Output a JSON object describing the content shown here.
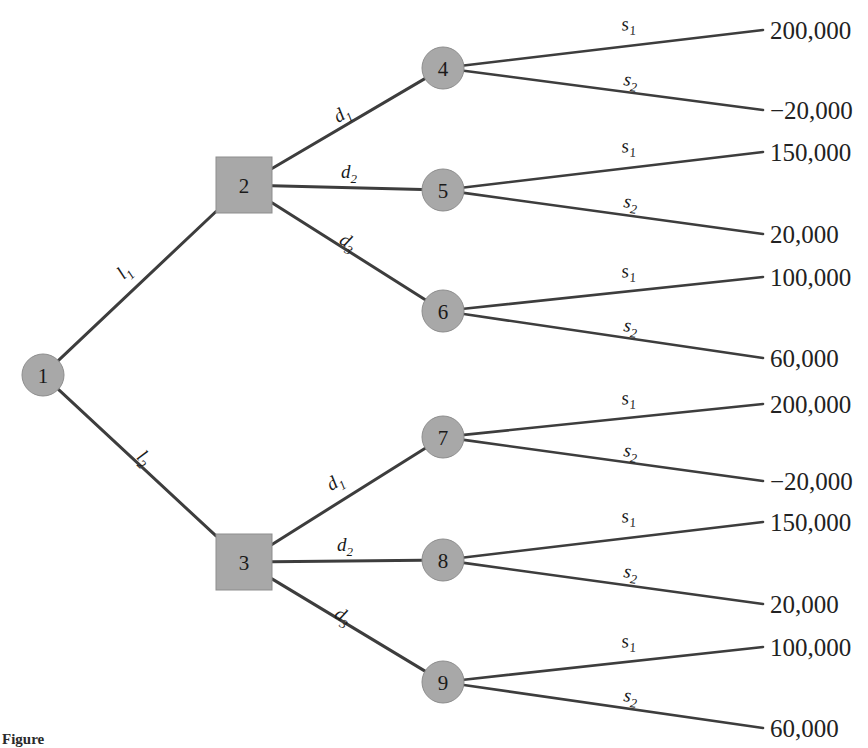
{
  "figure": {
    "caption_prefix": "Figure",
    "caption_number": "",
    "caption_text": ""
  },
  "nodes": [
    {
      "id": "1",
      "label": "1",
      "type": "chance",
      "shape": "circle",
      "cx": 43,
      "cy": 375
    },
    {
      "id": "2",
      "label": "2",
      "type": "decision",
      "shape": "square",
      "cx": 244,
      "cy": 185
    },
    {
      "id": "3",
      "label": "3",
      "type": "decision",
      "shape": "square",
      "cx": 244,
      "cy": 562
    },
    {
      "id": "4",
      "label": "4",
      "type": "chance",
      "shape": "circle",
      "cx": 443,
      "cy": 68
    },
    {
      "id": "5",
      "label": "5",
      "type": "chance",
      "shape": "circle",
      "cx": 443,
      "cy": 190
    },
    {
      "id": "6",
      "label": "6",
      "type": "chance",
      "shape": "circle",
      "cx": 443,
      "cy": 311
    },
    {
      "id": "7",
      "label": "7",
      "type": "chance",
      "shape": "circle",
      "cx": 443,
      "cy": 437
    },
    {
      "id": "8",
      "label": "8",
      "type": "chance",
      "shape": "circle",
      "cx": 443,
      "cy": 560
    },
    {
      "id": "9",
      "label": "9",
      "type": "chance",
      "shape": "circle",
      "cx": 443,
      "cy": 682
    }
  ],
  "branches": {
    "from_root": [
      {
        "base": "l",
        "sub": "1",
        "label": "l1",
        "to": "2",
        "label_x": 128,
        "label_y": 276
      },
      {
        "base": "l",
        "sub": "2",
        "label": "l2",
        "to": "3",
        "label_x": 140,
        "label_y": 462
      }
    ],
    "decision_upper": [
      {
        "base": "d",
        "sub": "1",
        "label": "d1",
        "to": "4",
        "label_x": 345,
        "label_y": 119
      },
      {
        "base": "d",
        "sub": "2",
        "label": "d2",
        "to": "5",
        "label_x": 349,
        "label_y": 178
      },
      {
        "base": "d",
        "sub": "3",
        "label": "d3",
        "to": "6",
        "label_x": 345,
        "label_y": 247
      }
    ],
    "decision_lower": [
      {
        "base": "d",
        "sub": "1",
        "label": "d1",
        "to": "7",
        "label_x": 338,
        "label_y": 487
      },
      {
        "base": "d",
        "sub": "2",
        "label": "d2",
        "to": "8",
        "label_x": 345,
        "label_y": 551
      },
      {
        "base": "d",
        "sub": "3",
        "label": "d3",
        "to": "9",
        "label_x": 340,
        "label_y": 621
      }
    ]
  },
  "state_labels": [
    {
      "base": "s",
      "sub": "1",
      "label": "s1"
    },
    {
      "base": "s",
      "sub": "2",
      "label": "s2"
    }
  ],
  "outcomes": [
    {
      "node": "4",
      "state_base": "s",
      "state_sub": "1",
      "state": "s1",
      "payoff": "200,000",
      "label_x": 629,
      "label_y": 30,
      "line_y2": 30,
      "text_y": 30
    },
    {
      "node": "4",
      "state_base": "s",
      "state_sub": "2",
      "state": "s2",
      "payoff": "−20,000",
      "label_x": 630,
      "label_y": 86,
      "line_y2": 110,
      "text_y": 110
    },
    {
      "node": "5",
      "state_base": "s",
      "state_sub": "1",
      "state": "s1",
      "payoff": "150,000",
      "label_x": 629,
      "label_y": 152,
      "line_y2": 152,
      "text_y": 152
    },
    {
      "node": "5",
      "state_base": "s",
      "state_sub": "2",
      "state": "s2",
      "payoff": "20,000",
      "label_x": 630,
      "label_y": 208,
      "line_y2": 234,
      "text_y": 234
    },
    {
      "node": "6",
      "state_base": "s",
      "state_sub": "1",
      "state": "s1",
      "payoff": "100,000",
      "label_x": 629,
      "label_y": 277,
      "line_y2": 277,
      "text_y": 277
    },
    {
      "node": "6",
      "state_base": "s",
      "state_sub": "2",
      "state": "s2",
      "payoff": "60,000",
      "label_x": 630,
      "label_y": 332,
      "line_y2": 358,
      "text_y": 358
    },
    {
      "node": "7",
      "state_base": "s",
      "state_sub": "1",
      "state": "s1",
      "payoff": "200,000",
      "label_x": 629,
      "label_y": 404,
      "line_y2": 404,
      "text_y": 404
    },
    {
      "node": "7",
      "state_base": "s",
      "state_sub": "2",
      "state": "s2",
      "payoff": "−20,000",
      "label_x": 630,
      "label_y": 457,
      "line_y2": 481,
      "text_y": 481
    },
    {
      "node": "8",
      "state_base": "s",
      "state_sub": "1",
      "state": "s1",
      "payoff": "150,000",
      "label_x": 629,
      "label_y": 522,
      "line_y2": 522,
      "text_y": 522
    },
    {
      "node": "8",
      "state_base": "s",
      "state_sub": "2",
      "state": "s2",
      "payoff": "20,000",
      "label_x": 630,
      "label_y": 578,
      "line_y2": 604,
      "text_y": 604
    },
    {
      "node": "9",
      "state_base": "s",
      "state_sub": "1",
      "state": "s1",
      "payoff": "100,000",
      "label_x": 629,
      "label_y": 647,
      "line_y2": 647,
      "text_y": 647
    },
    {
      "node": "9",
      "state_base": "s",
      "state_sub": "2",
      "state": "s2",
      "payoff": "60,000",
      "label_x": 630,
      "label_y": 702,
      "line_y2": 728,
      "text_y": 728
    }
  ],
  "colors": {
    "node_fill": "#a8a8a8",
    "node_stroke": "#8d8d8d",
    "edge": "#3d3d3d",
    "text": "#1a1a1a",
    "background": "#ffffff"
  },
  "geometry": {
    "circle_radius": 21,
    "square_half": 28,
    "terminal_x": 763,
    "payoff_text_x": 770,
    "branch_x_start": 272,
    "node_col_x": 443
  }
}
